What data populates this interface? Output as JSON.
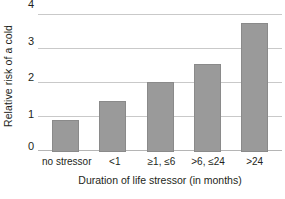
{
  "chart_data": {
    "type": "bar",
    "title": "",
    "subtitle": "",
    "xlabel": "Duration of life stressor (in months)",
    "ylabel": "Relative risk of a cold",
    "categories": [
      "no stressor",
      "<1",
      "≥1, ≤6",
      ">6, ≤24",
      ">24"
    ],
    "values": [
      0.95,
      1.5,
      2.05,
      2.6,
      3.8
    ],
    "ylim": [
      0,
      4
    ],
    "yticks": [
      0,
      1,
      2,
      3,
      4
    ],
    "ytick_labels": [
      "0",
      "1",
      "2",
      "3",
      "4"
    ],
    "grid": true,
    "grid_axis": "y",
    "legend": false,
    "legend_position": "none",
    "series": [
      {
        "name": "Relative risk of a cold",
        "values": [
          0.95,
          1.5,
          2.05,
          2.6,
          3.8
        ]
      }
    ],
    "colors": {
      "bar_fill": "#9a9a9a",
      "bar_border": "#8a8a8a",
      "gridline": "#c9c9c9",
      "axis_line": "#b5b5b5",
      "text": "#231f20",
      "background": "#ffffff"
    }
  }
}
